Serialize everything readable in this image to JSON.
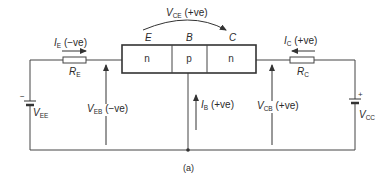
{
  "diagram": {
    "type": "circuit",
    "caption": "(a)",
    "transistor": {
      "terminals": {
        "emitter": "E",
        "base": "B",
        "collector": "C"
      },
      "regions": [
        "n",
        "p",
        "n"
      ]
    },
    "labels": {
      "vce": {
        "sym": "V",
        "sub": "CE",
        "note": "(+ve)"
      },
      "ie": {
        "sym": "I",
        "sub": "E",
        "note": "(−ve)"
      },
      "ic": {
        "sym": "I",
        "sub": "C",
        "note": "(+ve)"
      },
      "ib": {
        "sym": "I",
        "sub": "B",
        "note": "(+ve)"
      },
      "veb": {
        "sym": "V",
        "sub": "EB",
        "note": "(−ve)"
      },
      "vcb": {
        "sym": "V",
        "sub": "CB",
        "note": "(+ve)"
      },
      "re": {
        "sym": "R",
        "sub": "E"
      },
      "rc": {
        "sym": "R",
        "sub": "C"
      },
      "vee": {
        "sym": "V",
        "sub": "EE",
        "polarity": "−"
      },
      "vcc": {
        "sym": "V",
        "sub": "CC",
        "polarity": "+"
      }
    },
    "colors": {
      "line": "#333333",
      "background": "#ffffff"
    }
  }
}
